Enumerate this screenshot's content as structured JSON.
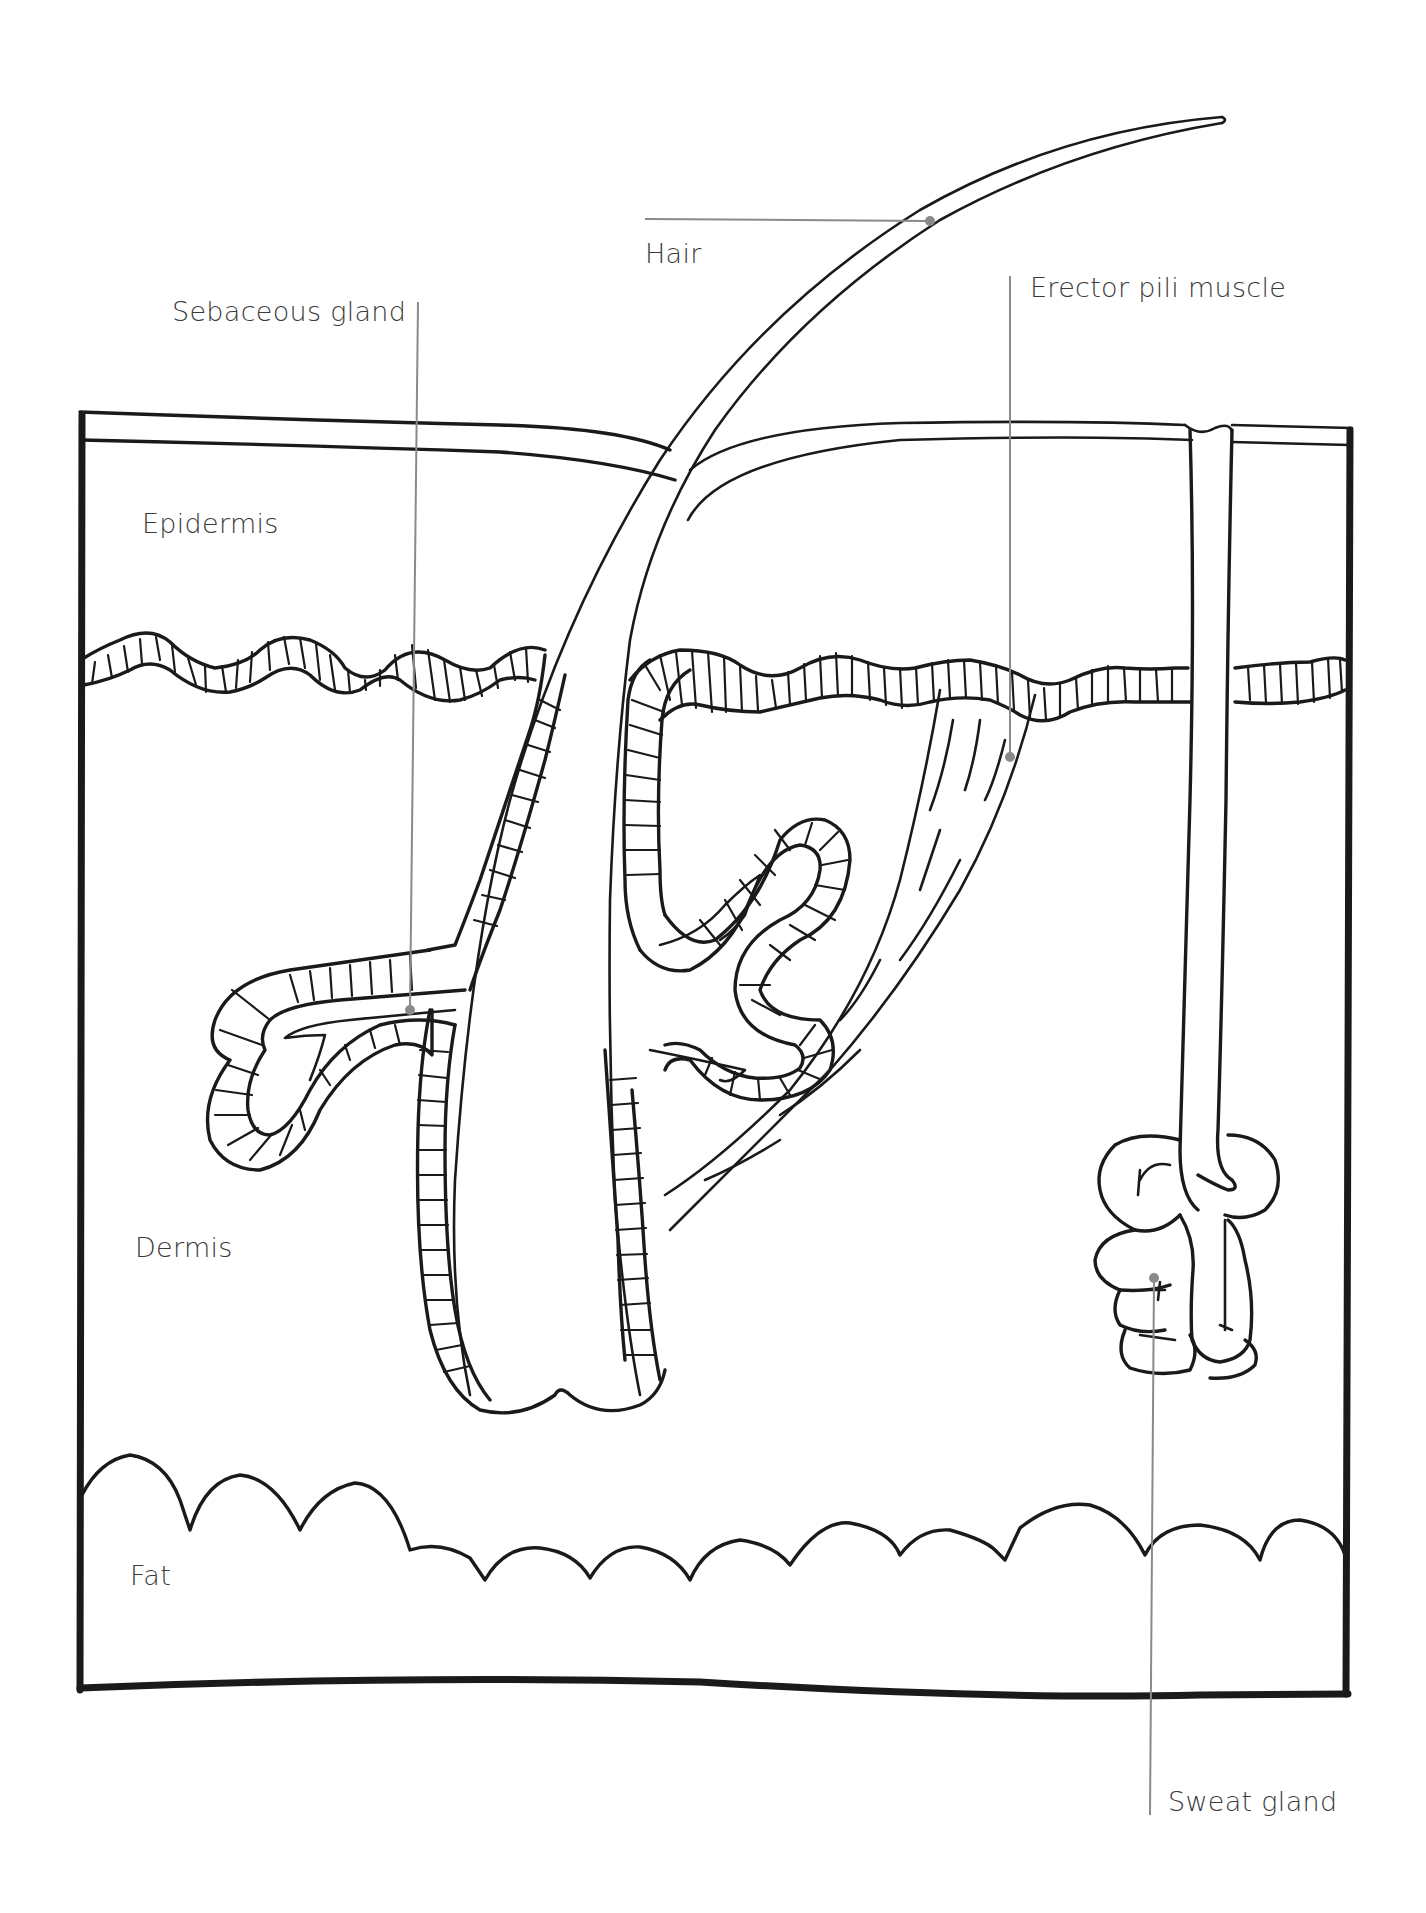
{
  "diagram": {
    "type": "anatomical-cross-section",
    "colors": {
      "ink": "#1a1a1a",
      "leader": "#8a8a8a",
      "label_text": "#3a3a3a",
      "background": "#ffffff"
    },
    "layers": [
      {
        "id": "epidermis",
        "label": "Epidermis"
      },
      {
        "id": "dermis",
        "label": "Dermis"
      },
      {
        "id": "fat",
        "label": "Fat"
      }
    ],
    "callouts": [
      {
        "id": "hair",
        "label": "Hair"
      },
      {
        "id": "sebaceous-gland",
        "label": "Sebaceous gland"
      },
      {
        "id": "erector-pili-muscle",
        "label": "Erector pili muscle"
      },
      {
        "id": "sweat-gland",
        "label": "Sweat gland"
      }
    ]
  }
}
